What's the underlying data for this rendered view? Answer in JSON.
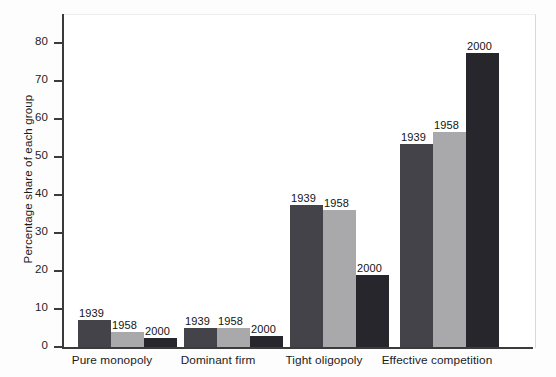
{
  "chart_data": {
    "type": "bar",
    "title": "",
    "xlabel": "",
    "ylabel": "Percentage share of each group",
    "ylim": [
      0,
      80
    ],
    "yticks": [
      0,
      10,
      20,
      30,
      40,
      50,
      60,
      70,
      80
    ],
    "ytick_labels": [
      "0",
      "10",
      "20",
      "30",
      "40",
      "50",
      "60",
      "70",
      "80"
    ],
    "grid": false,
    "legend": "none",
    "legend_position": "data-labels-above-bars",
    "categories": [
      "Pure monopoly",
      "Dominant firm",
      "Tight oligopoly",
      "Effective competition"
    ],
    "series": [
      {
        "name": "1939",
        "color": "#434349",
        "values": [
          7,
          5,
          37.5,
          53.5
        ]
      },
      {
        "name": "1958",
        "color": "#a9a9ab",
        "values": [
          4,
          5,
          36,
          56.5
        ]
      },
      {
        "name": "2000",
        "color": "#26262c",
        "values": [
          2.5,
          3,
          19,
          77.5
        ]
      }
    ],
    "annotations": [
      {
        "text": "1939",
        "category": "Pure monopoly",
        "series": "1939"
      },
      {
        "text": "1958",
        "category": "Pure monopoly",
        "series": "1958"
      },
      {
        "text": "2000",
        "category": "Pure monopoly",
        "series": "2000"
      },
      {
        "text": "1939",
        "category": "Dominant firm",
        "series": "1939"
      },
      {
        "text": "1958",
        "category": "Dominant firm",
        "series": "1958"
      },
      {
        "text": "2000",
        "category": "Dominant firm",
        "series": "2000"
      },
      {
        "text": "1939",
        "category": "Tight oligopoly",
        "series": "1939"
      },
      {
        "text": "1958",
        "category": "Tight oligopoly",
        "series": "1958"
      },
      {
        "text": "2000",
        "category": "Tight oligopoly",
        "series": "2000"
      },
      {
        "text": "1939",
        "category": "Effective competition",
        "series": "1939"
      },
      {
        "text": "1958",
        "category": "Effective competition",
        "series": "1958"
      },
      {
        "text": "2000",
        "category": "Effective competition",
        "series": "2000"
      }
    ]
  },
  "background_bleed": {
    "note": "faint mirrored show-through text from the reverse printed page",
    "lines": [
      "the market structure of the economy has",
      "changed over time as new firms entered",
      "and concentration ratios fell in many",
      "industries across the United States",
      "Effective Competition"
    ]
  }
}
